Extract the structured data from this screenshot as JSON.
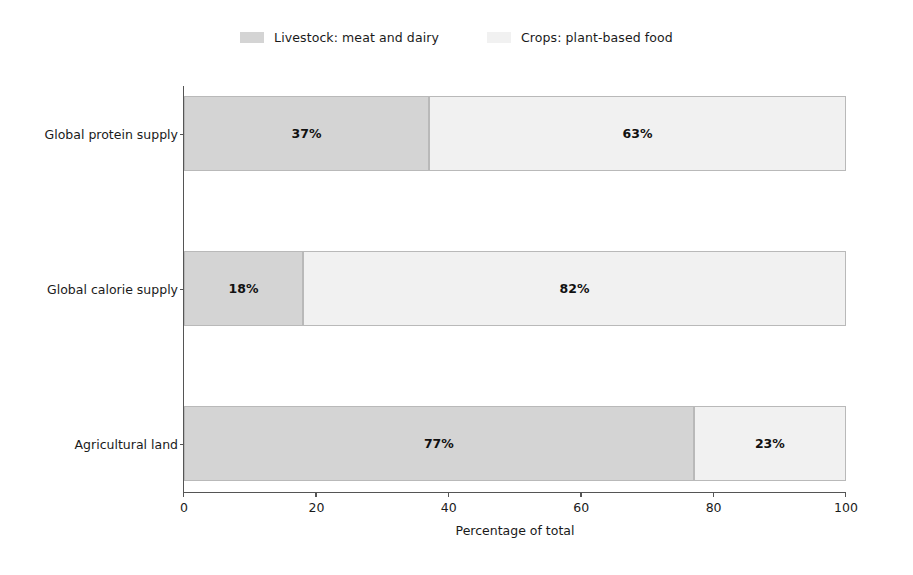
{
  "chart_data": {
    "type": "bar",
    "subtype": "horizontal-stacked-bar",
    "title": "",
    "subtitle": "",
    "xlabel": "Percentage of total",
    "ylabel": "",
    "xlim": [
      0,
      100
    ],
    "xticks": [
      0,
      20,
      40,
      60,
      80,
      100
    ],
    "xticklabels": [
      "0",
      "20",
      "40",
      "60",
      "80",
      "100"
    ],
    "grid": false,
    "legend_position": "top-center",
    "categories": [
      "Global protein supply",
      "Global calorie supply",
      "Agricultural land"
    ],
    "series": [
      {
        "name": "Livestock: meat and dairy",
        "color": "#d4d4d4",
        "values": [
          37,
          18,
          77
        ],
        "labels": [
          "37%",
          "18%",
          "77%"
        ]
      },
      {
        "name": "Crops: plant-based food",
        "color": "#f1f1f1",
        "values": [
          63,
          82,
          23
        ],
        "labels": [
          "63%",
          "82%",
          "23%"
        ]
      }
    ]
  },
  "legend": {
    "entries": [
      {
        "label": "Livestock: meat and dairy",
        "color": "#d4d4d4"
      },
      {
        "label": "Crops: plant-based food",
        "color": "#f1f1f1"
      }
    ]
  },
  "axes": {
    "x_axis_label": "Percentage of total",
    "x_tick_labels": [
      "0",
      "20",
      "40",
      "60",
      "80",
      "100"
    ],
    "y_tick_labels": [
      "Global protein supply",
      "Global calorie supply",
      "Agricultural land"
    ]
  },
  "colors": {
    "livestock": "#d4d4d4",
    "crops": "#f1f1f1",
    "bar_edge": "#b9b9b9",
    "axis": "#555555",
    "text": "#1a1a1a",
    "background": "#ffffff"
  }
}
